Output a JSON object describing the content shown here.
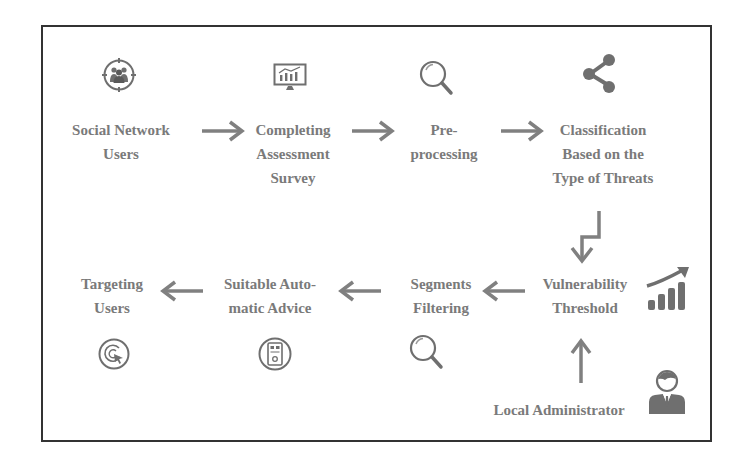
{
  "diagram": {
    "colors": {
      "text": "#7a7a7a",
      "icon": "#6f6f6f",
      "arrow": "#808080",
      "frame": "#333333"
    },
    "nodes": [
      {
        "id": "social-network-users",
        "lines": [
          "Social Network",
          "Users"
        ],
        "icon": "users-target-icon"
      },
      {
        "id": "completing-assessment-survey",
        "lines": [
          "Completing",
          "Assessment",
          "Survey"
        ],
        "icon": "monitor-chart-icon"
      },
      {
        "id": "pre-processing",
        "lines": [
          "Pre-",
          "processing"
        ],
        "icon": "magnifier-icon"
      },
      {
        "id": "classification",
        "lines": [
          "Classification",
          "Based on the",
          "Type of Threats"
        ],
        "icon": "share-icon"
      },
      {
        "id": "vulnerability-threshold",
        "lines": [
          "Vulnerability",
          "Threshold"
        ],
        "icon": "growth-chart-icon"
      },
      {
        "id": "segments-filtering",
        "lines": [
          "Segments",
          "Filtering"
        ],
        "icon": "magnifier-icon"
      },
      {
        "id": "suitable-automatic-advice",
        "lines": [
          "Suitable Auto-",
          "matic Advice"
        ],
        "icon": "device-circle-icon"
      },
      {
        "id": "targeting-users",
        "lines": [
          "Targeting",
          "Users"
        ],
        "icon": "target-cursor-icon"
      },
      {
        "id": "local-administrator",
        "lines": [
          "Local Administrator"
        ],
        "icon": "administrator-icon"
      }
    ],
    "edges": [
      {
        "from": "social-network-users",
        "to": "completing-assessment-survey",
        "direction": "right"
      },
      {
        "from": "completing-assessment-survey",
        "to": "pre-processing",
        "direction": "right"
      },
      {
        "from": "pre-processing",
        "to": "classification",
        "direction": "right"
      },
      {
        "from": "classification",
        "to": "vulnerability-threshold",
        "direction": "down-elbow"
      },
      {
        "from": "vulnerability-threshold",
        "to": "segments-filtering",
        "direction": "left"
      },
      {
        "from": "segments-filtering",
        "to": "suitable-automatic-advice",
        "direction": "left"
      },
      {
        "from": "suitable-automatic-advice",
        "to": "targeting-users",
        "direction": "left"
      },
      {
        "from": "local-administrator",
        "to": "vulnerability-threshold",
        "direction": "up"
      }
    ]
  }
}
